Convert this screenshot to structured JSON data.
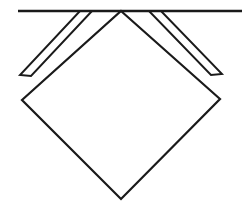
{
  "figure": {
    "canvas": {
      "width": 242,
      "height": 209,
      "background_color": "#ffffff"
    },
    "style": {
      "stroke_color": "#1a1a1a",
      "fill_color": "#ffffff",
      "stroke_width": 2.2,
      "thin_stroke_width": 1.9,
      "baseline_stroke_width": 2.6
    },
    "geometry": {
      "baseline": {
        "name": "horizontal-baseline",
        "x1": 18,
        "y1": 11,
        "x2": 242,
        "y2": 11
      },
      "diamond": {
        "name": "central-diamond",
        "top": [
          121,
          11
        ],
        "right": [
          220,
          99
        ],
        "bottom": [
          121,
          199
        ],
        "left": [
          22,
          100
        ]
      },
      "left_band": {
        "name": "left-folded-strip",
        "outer_top": [
          80,
          11
        ],
        "outer_corner": [
          20,
          75
        ],
        "inner_corner": [
          31,
          76
        ],
        "inner_top": [
          92,
          11
        ]
      },
      "right_band": {
        "name": "right-folded-strip",
        "outer_top": [
          161,
          11
        ],
        "outer_corner": [
          222,
          74
        ],
        "inner_corner": [
          211,
          75
        ],
        "inner_top": [
          149,
          11
        ]
      }
    },
    "paths": {
      "baseline": "M 18 11 L 242 11",
      "diamond": "M 121 11 L 220 99 L 121 199 L 22 100 Z",
      "left_band": "M 80 11 L 20 75 L 31 76 L 92 11",
      "right_band": "M 161 11 L 222 74 L 211 75 L 149 11"
    }
  }
}
